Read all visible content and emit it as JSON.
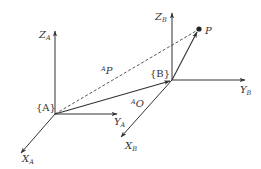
{
  "diagram": {
    "type": "coordinate-frame-transform",
    "colors": {
      "line": "#333333",
      "background": "#ffffff"
    },
    "frames": [
      {
        "name": "A",
        "label": "{A}",
        "origin": [
          55,
          114
        ],
        "axes": {
          "Z": {
            "end": [
              55,
              30
            ],
            "label_main": "Z",
            "label_sub": "A"
          },
          "Y": {
            "end": [
              118,
              114
            ],
            "label_main": "Y",
            "label_sub": "A"
          },
          "X": {
            "end": [
              20,
              154
            ],
            "label_main": "X",
            "label_sub": "A"
          }
        }
      },
      {
        "name": "B",
        "label": "{B}",
        "origin": [
          172,
          80
        ],
        "axes": {
          "Z": {
            "end": [
              172,
              12
            ],
            "label_main": "Z",
            "label_sub": "B"
          },
          "Y": {
            "end": [
              246,
              80
            ],
            "label_main": "Y",
            "label_sub": "B"
          },
          "X": {
            "end": [
              120,
              138
            ],
            "label_main": "X",
            "label_sub": "B"
          }
        }
      }
    ],
    "point": {
      "label": "P",
      "position": [
        199,
        29
      ]
    },
    "vectors": [
      {
        "name": "A-to-P",
        "style": "dashed",
        "label_sup": "A",
        "label_main": "P"
      },
      {
        "name": "A-to-B",
        "style": "solid",
        "label_sup": "A",
        "label_main": "O"
      },
      {
        "name": "B-to-P",
        "style": "solid"
      }
    ]
  }
}
